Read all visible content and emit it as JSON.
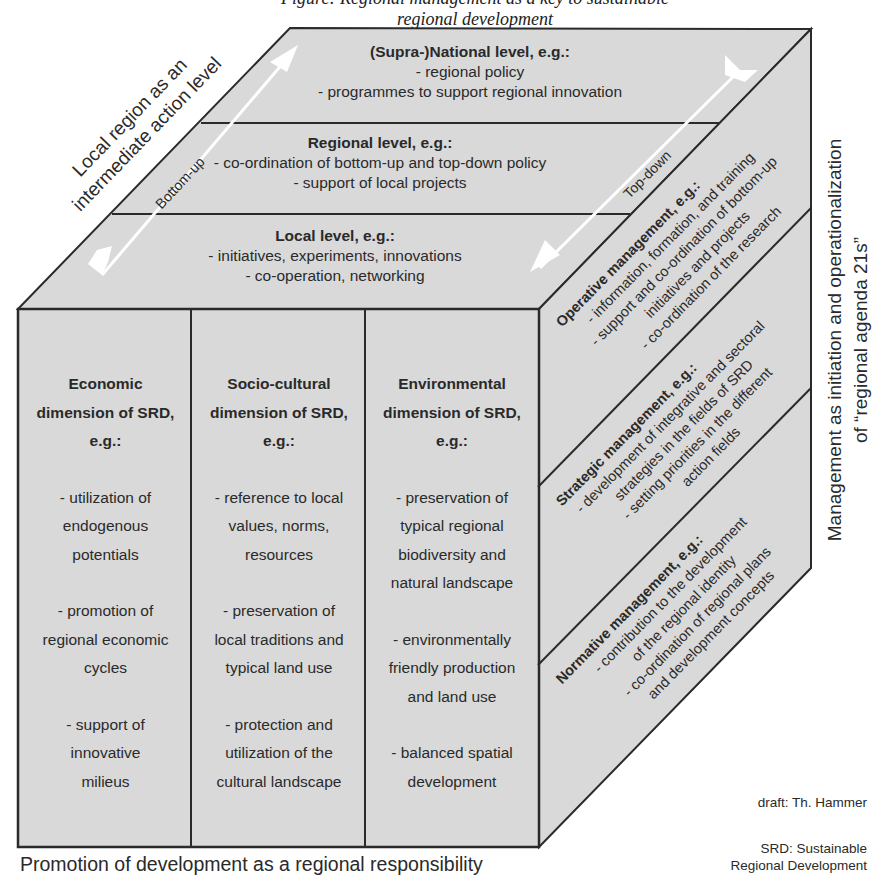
{
  "caption_top": "Figure: Regional management as a key to sustainable regional development",
  "top_face": {
    "levels": [
      {
        "title": "(Supra-)National level, e.g.:",
        "items": [
          "- regional policy",
          "- programmes to support regional innovation"
        ]
      },
      {
        "title": "Regional level, e.g.:",
        "items": [
          "- co-ordination of bottom-up and top-down policy",
          "- support of local projects"
        ]
      },
      {
        "title": "Local level, e.g.:",
        "items": [
          "- initiatives, experiments, innovations",
          "- co-operation, networking"
        ]
      }
    ],
    "arrow_up_label": "Bottom-up",
    "arrow_down_label": "Top-down"
  },
  "left_axis_label": {
    "line1": "Local region as an",
    "line2": "intermediate action level"
  },
  "front_face": {
    "columns": [
      {
        "title": [
          "Economic",
          "dimension of SRD,",
          "e.g.:"
        ],
        "items": [
          [
            "- utilization of",
            "endogenous",
            "potentials"
          ],
          [
            "- promotion of",
            "regional economic",
            "cycles"
          ],
          [
            "- support of",
            "innovative",
            "milieus"
          ]
        ]
      },
      {
        "title": [
          "Socio-cultural",
          "dimension of SRD,",
          "e.g.:"
        ],
        "items": [
          [
            "- reference to local",
            "values, norms,",
            "resources"
          ],
          [
            "- preservation of",
            "local traditions and",
            "typical land use"
          ],
          [
            "- protection and",
            "utilization of the",
            "cultural landscape"
          ]
        ]
      },
      {
        "title": [
          "Environmental",
          "dimension of SRD,",
          "e.g.:"
        ],
        "items": [
          [
            "- preservation of",
            "typical regional",
            "biodiversity and",
            "natural landscape"
          ],
          [
            "- environmentally",
            "friendly production",
            "and land use"
          ],
          [
            "- balanced spatial",
            "development"
          ]
        ]
      }
    ]
  },
  "bottom_axis_label": "Promotion of development as a regional responsibility",
  "right_face": {
    "sections": [
      {
        "title": "Operative management, e.g.:",
        "lines": [
          "- information, formation, and training",
          "- support and co-ordination of bottom-up",
          "initiatives and projects",
          "- co-ordination of the research"
        ]
      },
      {
        "title": "Strategic management, e.g.:",
        "lines": [
          "- development of integrative and sectoral",
          "strategies in the fields of SRD",
          "- setting priorities in the different",
          "action fields"
        ]
      },
      {
        "title": "Normative management, e.g.:",
        "lines": [
          "- contribution to the development",
          "of the regional identity",
          "- co-ordination of regional plans",
          "and development concepts"
        ]
      }
    ]
  },
  "right_axis_label": {
    "line1": "Management as initiation and operationalization",
    "line2": "of “regional agenda 21s”"
  },
  "credits": {
    "draft": "draft: Th. Hammer",
    "srd_line1": "SRD: Sustainable",
    "srd_line2": "Regional Development"
  },
  "colors": {
    "face_fill": "#d9d9d9",
    "edge": "#2a2a2a",
    "arrow": "#ffffff"
  }
}
